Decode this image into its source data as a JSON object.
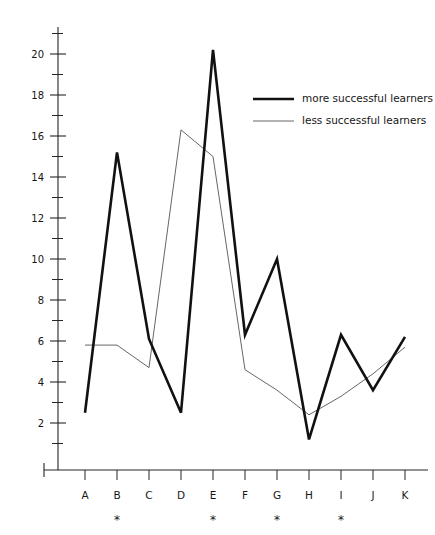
{
  "chart_data": {
    "type": "line",
    "title": "",
    "subtitle": "",
    "xlabel": "",
    "ylabel": "",
    "categories": [
      "A",
      "B",
      "C",
      "D",
      "E",
      "F",
      "G",
      "H",
      "I",
      "J",
      "K"
    ],
    "series": [
      {
        "name": "more successful learners",
        "style": "thick",
        "color": "#111111",
        "values": [
          2.5,
          15.2,
          6.1,
          2.5,
          20.2,
          6.3,
          10.0,
          1.2,
          6.3,
          3.6,
          6.2
        ]
      },
      {
        "name": "less successful learners",
        "style": "thin",
        "color": "#555555",
        "values": [
          5.8,
          5.8,
          4.7,
          16.3,
          15.0,
          4.6,
          3.6,
          2.4,
          3.3,
          4.4,
          5.7
        ]
      }
    ],
    "ylim": [
      0,
      21
    ],
    "xlim": [
      0,
      12
    ],
    "y_major_ticks": [
      2,
      4,
      6,
      8,
      10,
      12,
      14,
      16,
      18,
      20
    ],
    "y_minor_ticks": [
      1,
      3,
      5,
      7,
      9,
      11,
      13,
      15,
      17,
      19,
      21
    ],
    "y_tick_labels": [
      "2",
      "4",
      "6",
      "8",
      "10",
      "12",
      "14",
      "16",
      "18",
      "20"
    ],
    "grid": false,
    "legend_position": "upper-right",
    "annotations": {
      "significance_marker": "*",
      "significant_categories": [
        "B",
        "E",
        "G",
        "I"
      ]
    }
  },
  "legend": {
    "entries": [
      {
        "label": "more successful learners"
      },
      {
        "label": "less successful learners"
      }
    ]
  },
  "axes": {
    "x_labels": [
      "A",
      "B",
      "C",
      "D",
      "E",
      "F",
      "G",
      "H",
      "I",
      "J",
      "K"
    ],
    "y_labels": [
      "20",
      "18",
      "16",
      "14",
      "12",
      "10",
      "8",
      "6",
      "4",
      "2"
    ],
    "star_row": [
      "",
      "*",
      "",
      "",
      "*",
      "",
      "*",
      "",
      "*",
      "",
      ""
    ]
  }
}
